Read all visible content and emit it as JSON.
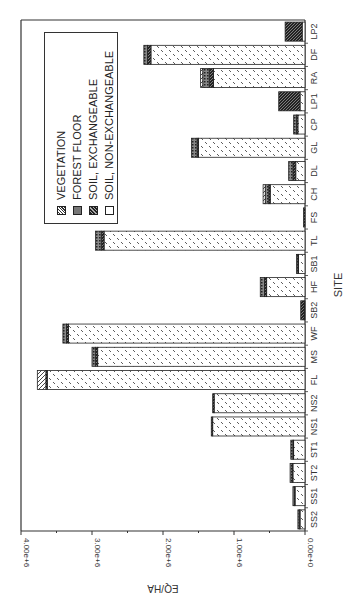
{
  "chart_data": {
    "type": "bar",
    "stacked": true,
    "orientation": "rotated-90deg",
    "title": "",
    "xlabel": "SITE",
    "ylabel": "EQ/HA",
    "ylim": [
      0,
      4000000
    ],
    "yticks": [
      "0.00e+0",
      "1.00e+6",
      "2.00e+6",
      "3.00e+6",
      "4.00e+6"
    ],
    "grid": false,
    "legend_position": "upper-left (rotated)",
    "categories": [
      "SS2",
      "SS1",
      "ST2",
      "ST1",
      "NS1",
      "NS2",
      "FL",
      "MS",
      "WF",
      "SB2",
      "HF",
      "SB1",
      "TL",
      "FS",
      "CH",
      "DL",
      "GL",
      "CP",
      "LP1",
      "RA",
      "DF",
      "LP2"
    ],
    "series": [
      {
        "name": "VEGETATION",
        "values": [
          0,
          0,
          0,
          0,
          0,
          0,
          120000.0,
          0,
          0,
          0,
          0,
          0,
          0,
          0,
          30000.0,
          0,
          0,
          0,
          0,
          30000.0,
          0,
          0
        ]
      },
      {
        "name": "FOREST FLOOR",
        "values": [
          20000.0,
          20000.0,
          30000.0,
          30000.0,
          0,
          0,
          0,
          50000.0,
          50000.0,
          0,
          60000.0,
          20000.0,
          80000.0,
          0,
          50000.0,
          60000.0,
          80000.0,
          40000.0,
          0,
          90000.0,
          50000.0,
          0
        ]
      },
      {
        "name": "SOIL, EXCHANGEABLE",
        "values": [
          10000.0,
          10000.0,
          10000.0,
          10000.0,
          20000.0,
          20000.0,
          20000.0,
          30000.0,
          30000.0,
          50000.0,
          30000.0,
          10000.0,
          40000.0,
          20000.0,
          20000.0,
          40000.0,
          20000.0,
          20000.0,
          300000.0,
          60000.0,
          50000.0,
          240000.0
        ]
      },
      {
        "name": "SOIL, NON-EXCHANGEABLE",
        "values": [
          70000.0,
          140000.0,
          170000.0,
          160000.0,
          1300000.0,
          1280000.0,
          3630000.0,
          2920000.0,
          3330000.0,
          10000.0,
          540000.0,
          90000.0,
          2830000.0,
          0,
          490000.0,
          130000.0,
          1500000.0,
          100000.0,
          70000.0,
          1290000.0,
          2170000.0,
          40000.0
        ]
      }
    ],
    "totals": [
      100000.0,
      170000.0,
      210000.0,
      200000.0,
      1320000.0,
      1300000.0,
      3770000.0,
      3000000.0,
      3410000.0,
      60000.0,
      630000.0,
      120000.0,
      2950000.0,
      20000.0,
      590000.0,
      230000.0,
      1600000.0,
      160000.0,
      370000.0,
      1470000.0,
      2270000.0,
      280000.0
    ]
  },
  "legend": {
    "items": [
      {
        "label": "VEGETATION",
        "pattern": "diagonal-light"
      },
      {
        "label": "FOREST FLOOR",
        "pattern": "crosshatch-grey"
      },
      {
        "label": "SOIL, EXCHANGEABLE",
        "pattern": "diagonal-dark"
      },
      {
        "label": "SOIL, NON-EXCHANGEABLE",
        "pattern": "dash-open"
      }
    ]
  },
  "axes": {
    "x_label": "SITE",
    "y_label": "EQ/HA"
  }
}
